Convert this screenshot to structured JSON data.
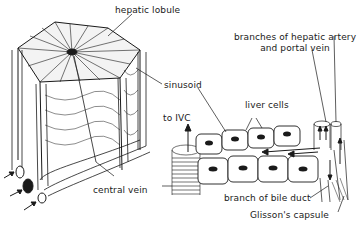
{
  "diagram": {
    "style": "black-and-white line illustration",
    "colors": {
      "ink": "#1a1a1a",
      "background": "#ffffff"
    },
    "labels": {
      "hepatic_lobule": "hepatic lobule",
      "sinusoid": "sinusoid",
      "central_vein": "central vein",
      "branches_line1": "branches of hepatic artery",
      "branches_line2": "and portal vein",
      "liver_cells": "liver cells",
      "to_ivc": "to IVC",
      "bile_duct": "branch of bile duct",
      "glissons_capsule": "Glisson's capsule"
    },
    "panels": [
      {
        "name": "lobule-cross-section",
        "description": "Hexagonal lobule cylinder with radiating sinusoids and corner portal triads"
      },
      {
        "name": "sinusoid-enlargement",
        "description": "Rows of liver cells along a sinusoid draining toward the central vein (to IVC)"
      }
    ]
  }
}
